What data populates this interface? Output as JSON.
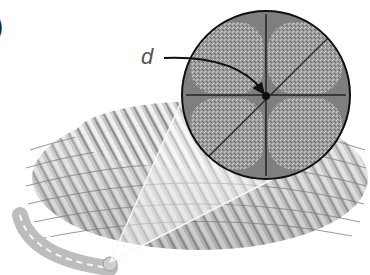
{
  "figure": {
    "panel_label_fragment": ")",
    "dimension_label": "d",
    "cross_section": {
      "strand_count": 4,
      "center": [
        266,
        95
      ],
      "radius": 84
    },
    "colors": {
      "background": "#ffffff",
      "rope_light": "#e4e4e4",
      "rope_mid": "#b4b4b4",
      "rope_dark": "#6e6e6e",
      "strand_fill": "#9a9a9a",
      "outline": "#111111",
      "label": "#555555"
    }
  }
}
